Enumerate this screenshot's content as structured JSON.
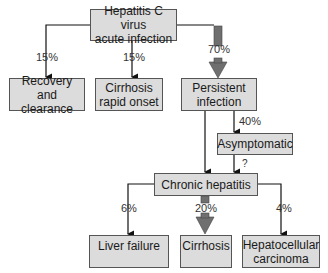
{
  "nodes": {
    "acute": "Hepatitis C virus\nacute infection",
    "recovery": "Recovery and\nclearance",
    "cirrhosis_rapid": "Cirrhosis\nrapid onset",
    "persistent": "Persistent\ninfection",
    "asymptomatic": "Asymptomatic",
    "chronic": "Chronic hepatitis",
    "liver_failure": "Liver failure",
    "cirrhosis": "Cirrhosis",
    "hcc": "Hepatocellular\ncarcinoma"
  },
  "edges": {
    "acute_recovery": "15%",
    "acute_cirrhosis_rapid": "15%",
    "acute_persistent": "70%",
    "persistent_asymptomatic": "40%",
    "asymptomatic_chronic": "?",
    "chronic_liver_failure": "6%",
    "chronic_cirrhosis": "20%",
    "chronic_hcc": "4%"
  }
}
